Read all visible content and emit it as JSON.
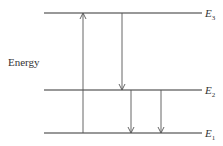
{
  "diagram": {
    "axis_label": "Energy",
    "levels": [
      {
        "name": "E",
        "sub": "3",
        "y": 13
      },
      {
        "name": "E",
        "sub": "2",
        "y": 90
      },
      {
        "name": "E",
        "sub": "1",
        "y": 133
      }
    ],
    "transitions": [
      {
        "from": "E1",
        "to": "E3",
        "direction": "up"
      },
      {
        "from": "E3",
        "to": "E2",
        "direction": "down"
      },
      {
        "from": "E2",
        "to": "E1",
        "direction": "down"
      },
      {
        "from": "E2",
        "to": "E1",
        "direction": "down"
      }
    ],
    "colors": {
      "line": "#333333",
      "arrow": "#555555"
    }
  }
}
